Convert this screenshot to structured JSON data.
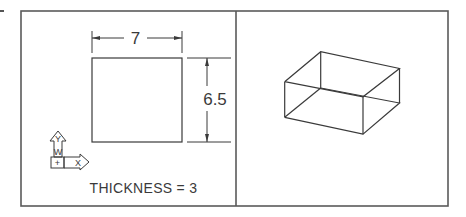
{
  "figure": {
    "type": "cad-drawing",
    "colors": {
      "line": "#3a3a3a",
      "frame": "#5a5a5a",
      "background": "#ffffff"
    },
    "left_view": {
      "label": "plan-view",
      "rectangle": {
        "width_label": "7",
        "height_label": "6.5"
      },
      "ucs_icon": {
        "y_label": "Y",
        "w_label": "W",
        "origin_label": "+",
        "x_label": "X"
      },
      "caption": "THICKNESS = 3"
    },
    "right_view": {
      "label": "isometric-view",
      "object": "extruded-box-wireframe"
    }
  }
}
